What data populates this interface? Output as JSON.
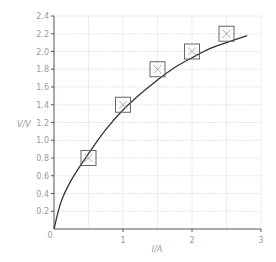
{
  "chart_data": {
    "type": "scatter",
    "title": "",
    "xlabel": "I/A",
    "ylabel": "V/V",
    "xlim": [
      0,
      3
    ],
    "ylim": [
      0,
      2.4
    ],
    "x_ticks": [
      "0",
      "1",
      "2",
      "3"
    ],
    "y_ticks": [
      "0.2",
      "0.4",
      "0.6",
      "0.8",
      "1.0",
      "1.2",
      "1.4",
      "1.6",
      "1.8",
      "2.0",
      "2.2",
      "2.4"
    ],
    "origin_label": "0",
    "grid": true,
    "grid_minor_x": 0.5,
    "grid_minor_y": 0.2,
    "series": [
      {
        "name": "measured points",
        "marker": "boxed-cross",
        "x": [
          0.5,
          1.0,
          1.5,
          2.0,
          2.5
        ],
        "y": [
          0.8,
          1.4,
          1.8,
          2.0,
          2.2
        ]
      },
      {
        "name": "best-fit curve",
        "marker": "line",
        "x": [
          0,
          0.1,
          0.25,
          0.5,
          0.75,
          1.0,
          1.25,
          1.5,
          1.75,
          2.0,
          2.25,
          2.5,
          2.8
        ],
        "y": [
          0,
          0.3,
          0.55,
          0.85,
          1.12,
          1.34,
          1.52,
          1.68,
          1.82,
          1.93,
          2.03,
          2.1,
          2.18
        ]
      }
    ],
    "colors": {
      "grid": "#d9d9d9",
      "axis": "#555555",
      "curve": "#333333",
      "marker": "#666666",
      "cross": "#aaaaaa",
      "text": "#9a9a9a"
    }
  }
}
